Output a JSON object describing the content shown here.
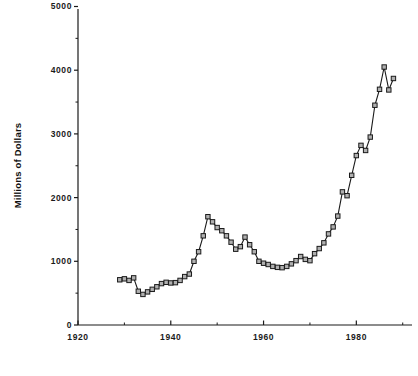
{
  "chart_data": {
    "type": "line",
    "title": "",
    "subtitle": "",
    "xlabel": "",
    "ylabel": "Millions of Dollars",
    "xlim": [
      1920,
      1992
    ],
    "ylim": [
      0,
      5000
    ],
    "grid": false,
    "legend": "none",
    "marker": "open-square",
    "line_color": "#1a1a1a",
    "marker_fill": "#b0b0b0",
    "marker_stroke": "#1a1a1a",
    "x_ticks_major": [
      1920,
      1940,
      1960,
      1980
    ],
    "x_tick_labels": [
      "1920",
      "1940",
      "1960",
      "1980"
    ],
    "x_ticks_minor": [
      1930,
      1950,
      1970,
      1990
    ],
    "y_ticks_major": [
      0,
      1000,
      2000,
      3000,
      4000,
      5000
    ],
    "y_tick_labels": [
      "0",
      "1000",
      "2000",
      "3000",
      "4000",
      "5000"
    ],
    "y_ticks_minor": [
      500,
      1500,
      2500,
      3500,
      4500
    ],
    "series": [
      {
        "name": "Value",
        "x": [
          1929,
          1930,
          1931,
          1932,
          1933,
          1934,
          1935,
          1936,
          1937,
          1938,
          1939,
          1940,
          1941,
          1942,
          1943,
          1944,
          1945,
          1946,
          1947,
          1948,
          1949,
          1950,
          1951,
          1952,
          1953,
          1954,
          1955,
          1956,
          1957,
          1958,
          1959,
          1960,
          1961,
          1962,
          1963,
          1964,
          1965,
          1966,
          1967,
          1968,
          1969,
          1970,
          1971,
          1972,
          1973,
          1974,
          1975,
          1976,
          1977,
          1978,
          1979,
          1980,
          1981,
          1982,
          1983,
          1984,
          1985,
          1986,
          1987,
          1988
        ],
        "y": [
          710,
          725,
          700,
          740,
          530,
          480,
          520,
          560,
          600,
          650,
          670,
          660,
          665,
          700,
          760,
          800,
          1000,
          1150,
          1400,
          1700,
          1620,
          1530,
          1480,
          1400,
          1300,
          1190,
          1230,
          1380,
          1260,
          1150,
          1000,
          970,
          950,
          920,
          905,
          900,
          920,
          960,
          1010,
          1075,
          1030,
          1010,
          1120,
          1200,
          1290,
          1430,
          1540,
          1710,
          2090,
          2030,
          2350,
          2660,
          2820,
          2740,
          2950,
          3450,
          3700,
          4050,
          3690,
          3870
        ]
      }
    ]
  },
  "axes": {
    "y_title": "Millions of Dollars"
  }
}
